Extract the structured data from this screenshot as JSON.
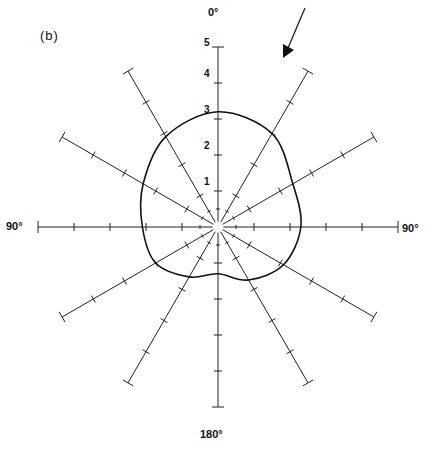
{
  "panel_label": "(b)",
  "direction_labels": {
    "top": "0°",
    "left": "90°",
    "right": "90°",
    "bottom": "180°"
  },
  "radial_ticks": [
    "1",
    "2",
    "3",
    "4",
    "5"
  ],
  "chart_data": {
    "type": "polar",
    "title": "(b)",
    "angular_labels": {
      "0": "0°",
      "90_left": "90°",
      "90_right": "90°",
      "180": "180°"
    },
    "spoke_angles_deg": [
      0,
      30,
      60,
      90,
      120,
      150,
      180,
      210,
      240,
      270,
      300,
      330
    ],
    "radial_ticks": [
      1,
      2,
      3,
      4,
      5
    ],
    "rlim": [
      0,
      5
    ],
    "grid": "radial spokes with tick marks every 1 unit",
    "series": [
      {
        "name": "polar response curve",
        "theta_deg": [
          0,
          30,
          60,
          90,
          120,
          150,
          180,
          210,
          240,
          270,
          300,
          330
        ],
        "r": [
          3.2,
          3.0,
          2.4,
          2.3,
          2.1,
          1.7,
          1.3,
          1.6,
          2.0,
          2.1,
          2.4,
          2.9
        ]
      }
    ],
    "annotations": [
      {
        "type": "arrow",
        "description": "arrow pointing toward origin from upper right, roughly along 30° direction"
      }
    ]
  }
}
